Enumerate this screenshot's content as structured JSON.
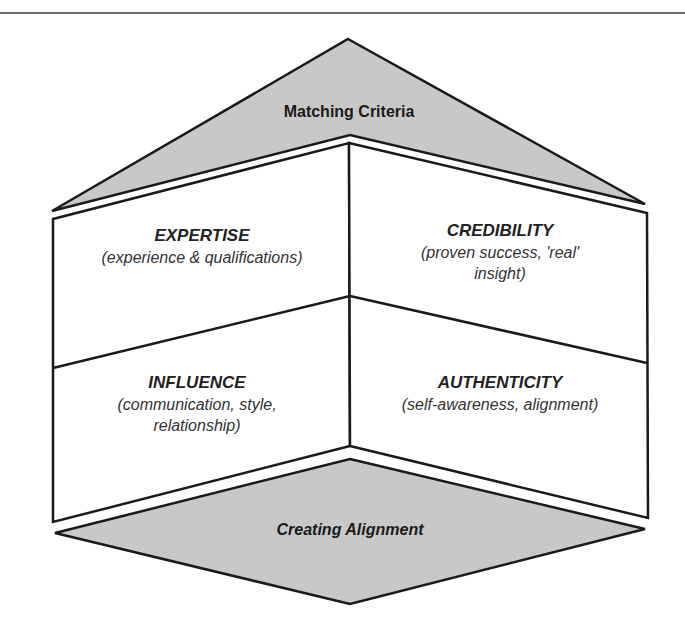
{
  "diagram": {
    "roof": {
      "label": "Matching Criteria",
      "fill": "#c8c8c8"
    },
    "quadrants": [
      {
        "position": "top-left",
        "title": "EXPERTISE",
        "subtitle_lines": [
          "(experience & qualifications)"
        ]
      },
      {
        "position": "top-right",
        "title": "CREDIBILITY",
        "subtitle_lines": [
          "(proven success, 'real'",
          "insight)"
        ]
      },
      {
        "position": "bottom-left",
        "title": "INFLUENCE",
        "subtitle_lines": [
          "(communication, style,",
          "relationship)"
        ]
      },
      {
        "position": "bottom-right",
        "title": "AUTHENTICITY",
        "subtitle_lines": [
          "(self-awareness, alignment)"
        ]
      }
    ],
    "base": {
      "label": "Creating Alignment",
      "fill": "#c8c8c8"
    },
    "colors": {
      "stroke": "#1a1a1a",
      "wall_fill": "#ffffff",
      "rule": "#6b6b6b"
    }
  }
}
